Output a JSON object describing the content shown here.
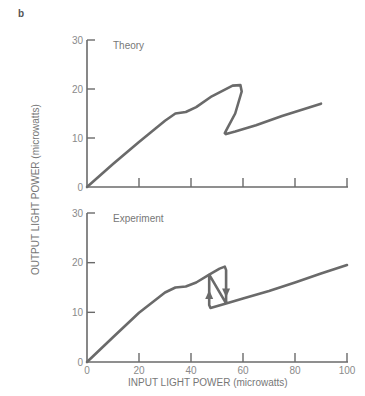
{
  "figure": {
    "panel_label": "b",
    "ylabel": "OUTPUT LIGHT POWER (microwatts)",
    "xlabel": "INPUT LIGHT POWER (microwatts)",
    "line_color": "#6a6a6a"
  },
  "chart_data": [
    {
      "type": "line",
      "title": "Theory",
      "xlabel": "INPUT LIGHT POWER (microwatts)",
      "ylabel": "OUTPUT LIGHT POWER (microwatts)",
      "xlim": [
        0,
        100
      ],
      "ylim": [
        0,
        30
      ],
      "x_ticks": [
        0,
        20,
        40,
        60,
        80,
        100
      ],
      "y_ticks": [
        0,
        10,
        20,
        30
      ],
      "y_tick_labels": [
        "0",
        "10",
        "20",
        "30"
      ],
      "grid": false,
      "series": [
        {
          "name": "Theory",
          "x": [
            0,
            10,
            20,
            30,
            34,
            38,
            42,
            48,
            56,
            59,
            59.5,
            57,
            54,
            53,
            53.5,
            57,
            65,
            75,
            90
          ],
          "y": [
            0,
            4.7,
            9.2,
            13.5,
            15,
            15.3,
            16.3,
            18.5,
            20.7,
            20.8,
            19.5,
            15,
            12,
            11,
            10.8,
            11.3,
            12.6,
            14.5,
            17
          ]
        }
      ]
    },
    {
      "type": "line",
      "title": "Experiment",
      "xlabel": "INPUT LIGHT POWER (microwatts)",
      "ylabel": "OUTPUT LIGHT POWER (microwatts)",
      "xlim": [
        0,
        100
      ],
      "ylim": [
        0,
        30
      ],
      "x_ticks": [
        0,
        20,
        40,
        60,
        80,
        100
      ],
      "x_tick_labels": [
        "0",
        "20",
        "40",
        "60",
        "80",
        "100"
      ],
      "y_ticks": [
        0,
        10,
        20,
        30
      ],
      "y_tick_labels": [
        "0",
        "10",
        "20",
        "30"
      ],
      "grid": false,
      "annotations": [
        {
          "type": "arrow-up",
          "x": 47,
          "y": 13.5,
          "label": "upward switching"
        },
        {
          "type": "arrow-down",
          "x": 53.5,
          "y": 14,
          "label": "downward switching"
        }
      ],
      "series": [
        {
          "name": "Experiment (hysteresis loop)",
          "x": [
            0,
            10,
            20,
            30,
            34,
            38,
            42,
            47,
            51,
            53,
            53.5,
            53.5,
            47.5,
            47,
            47,
            53.5,
            60,
            70,
            80,
            90,
            100
          ],
          "y": [
            0,
            5,
            9.9,
            14,
            15,
            15.2,
            16,
            17.6,
            18.8,
            19.2,
            18.5,
            11.8,
            10.9,
            11.5,
            17.6,
            11.8,
            12.8,
            14.3,
            16,
            17.8,
            19.5
          ]
        }
      ]
    }
  ]
}
